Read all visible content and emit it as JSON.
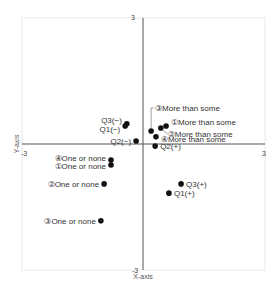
{
  "chart_data": {
    "type": "scatter",
    "title": "",
    "xlabel": "X-axis",
    "ylabel": "Y-axis",
    "xlim": [
      -3,
      3
    ],
    "ylim": [
      -3,
      3
    ],
    "grid": false,
    "tick_labels": {
      "x_min": "-3",
      "x_max": "3",
      "y_min": "-3",
      "y_max": "3"
    },
    "points": [
      {
        "label": "Q3(−)",
        "x": -0.4,
        "y": 0.48,
        "label_side": "left"
      },
      {
        "label": "Q1(−)",
        "x": -0.44,
        "y": 0.43,
        "label_side": "left"
      },
      {
        "label": "Q2(−)",
        "x": -0.17,
        "y": 0.07,
        "label_side": "left"
      },
      {
        "label": "③More than some",
        "x": 0.2,
        "y": 0.31,
        "label_side": "leader-up"
      },
      {
        "label": "①More than some",
        "x": 0.57,
        "y": 0.43,
        "label_side": "right"
      },
      {
        "label": "②More than some",
        "x": 0.44,
        "y": 0.38,
        "label_side": "leader-right"
      },
      {
        "label": "④More than some",
        "x": 0.32,
        "y": 0.17,
        "label_side": "right"
      },
      {
        "label": "Q2(+)",
        "x": 0.3,
        "y": -0.05,
        "label_side": "right"
      },
      {
        "label": "④One or none",
        "x": -0.79,
        "y": -0.38,
        "label_side": "left"
      },
      {
        "label": "①One or none",
        "x": -0.79,
        "y": -0.5,
        "label_side": "left"
      },
      {
        "label": "②One or none",
        "x": -0.96,
        "y": -0.95,
        "label_side": "left"
      },
      {
        "label": "③One or none",
        "x": -1.04,
        "y": -1.83,
        "label_side": "left"
      },
      {
        "label": "Q3(+)",
        "x": 0.94,
        "y": -0.95,
        "label_side": "right"
      },
      {
        "label": "Q1(+)",
        "x": 0.64,
        "y": -1.17,
        "label_side": "right"
      }
    ],
    "colors": {
      "point": "#111111",
      "axis": "#555555",
      "frame": "#e6e6e6"
    }
  }
}
